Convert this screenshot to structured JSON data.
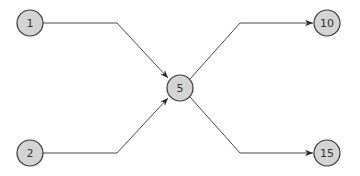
{
  "diagram": {
    "type": "directed-graph",
    "colors": {
      "node_fill": "#d4d4d4",
      "node_stroke": "#3a3a3a",
      "edge": "#4a4a4a"
    },
    "nodes": [
      {
        "id": "n1",
        "label": "1",
        "x": 30,
        "y": 23
      },
      {
        "id": "n2",
        "label": "2",
        "x": 30,
        "y": 153
      },
      {
        "id": "n5",
        "label": "5",
        "x": 180,
        "y": 88
      },
      {
        "id": "n10",
        "label": "10",
        "x": 327,
        "y": 23
      },
      {
        "id": "n15",
        "label": "15",
        "x": 327,
        "y": 153
      }
    ],
    "edges": [
      {
        "from": "1",
        "to": "5"
      },
      {
        "from": "2",
        "to": "5"
      },
      {
        "from": "5",
        "to": "10"
      },
      {
        "from": "5",
        "to": "15"
      }
    ]
  }
}
